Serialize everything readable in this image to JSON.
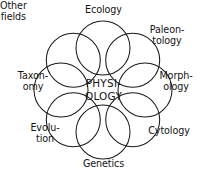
{
  "diagram": {
    "center": {
      "name": "physiology",
      "line1": "PHYSI-",
      "line2": "OLOGY"
    },
    "stroke_color": "#1a1a1a",
    "background_color": "#ffffff",
    "text_color": "#141414",
    "nodes": [
      {
        "id": "ecology",
        "label": "Ecology",
        "angle_deg": 270
      },
      {
        "id": "paleontology",
        "label": "Paleon-\ntology",
        "angle_deg": 315
      },
      {
        "id": "morphology",
        "label": "Morph-\nology",
        "angle_deg": 0
      },
      {
        "id": "cytology",
        "label": "Cytology",
        "angle_deg": 45
      },
      {
        "id": "genetics",
        "label": "Genetics",
        "angle_deg": 90
      },
      {
        "id": "evolution",
        "label": "Evolu-\ntion",
        "angle_deg": 135
      },
      {
        "id": "taxonomy",
        "label": "Taxon-\nomy",
        "angle_deg": 180
      },
      {
        "id": "other-fields",
        "label": "Other\nfields",
        "angle_deg": 225
      }
    ],
    "geometry": {
      "center_x": 103,
      "center_y": 90,
      "ring_radius": 42,
      "circle_radius": 27,
      "circle_count": 8
    }
  }
}
